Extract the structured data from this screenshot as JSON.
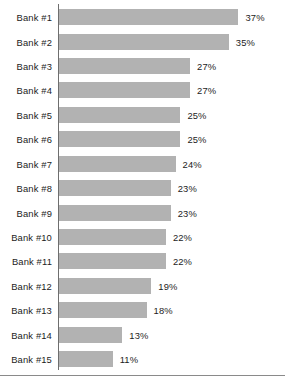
{
  "chart_data": {
    "type": "bar",
    "orientation": "horizontal",
    "title": "",
    "subtitle": "",
    "xlabel": "",
    "ylabel": "",
    "xlim": [
      0,
      37
    ],
    "grid": false,
    "legend": null,
    "value_label_suffix": "%",
    "categories": [
      "Bank #1",
      "Bank #2",
      "Bank #3",
      "Bank #4",
      "Bank #5",
      "Bank #6",
      "Bank #7",
      "Bank #8",
      "Bank #9",
      "Bank #10",
      "Bank #11",
      "Bank #12",
      "Bank #13",
      "Bank #14",
      "Bank #15"
    ],
    "values": [
      37,
      35,
      27,
      27,
      25,
      25,
      24,
      23,
      23,
      22,
      22,
      19,
      18,
      13,
      11
    ],
    "value_labels": [
      "37%",
      "35%",
      "27%",
      "27%",
      "25%",
      "25%",
      "24%",
      "23%",
      "23%",
      "22%",
      "22%",
      "19%",
      "18%",
      "13%",
      "11%"
    ],
    "colors": {
      "bar_fill": "#b2b2b2",
      "axis_line": "#6e6e6e",
      "bottom_rule": "#8a8a8a",
      "text": "#1c1c1c",
      "background": "#ffffff"
    }
  }
}
